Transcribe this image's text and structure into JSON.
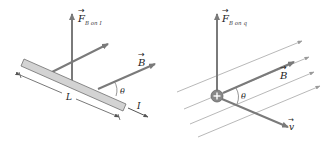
{
  "colors": {
    "arrow": "#7a7a7a",
    "field_line": "#9a9a9a",
    "bar_fill": "#d3d3d3",
    "bar_stroke": "#6e6e6e",
    "charge_fill": "#888888",
    "text": "#222222"
  },
  "left_panel": {
    "title": "Force on current-carrying wire",
    "force_label": {
      "main": "F",
      "sub": "B on I"
    },
    "field_label": "B",
    "angle_label": "θ",
    "length_label": "L",
    "current_label": "I"
  },
  "right_panel": {
    "title": "Force on moving charge",
    "force_label": {
      "main": "F",
      "sub": "B on q"
    },
    "field_label": "B",
    "angle_label": "θ",
    "velocity_label": "v",
    "charge_symbol": "+"
  }
}
